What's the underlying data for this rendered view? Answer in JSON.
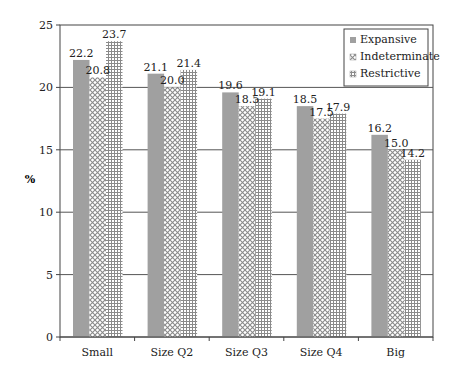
{
  "chart_data": {
    "type": "bar",
    "title": "",
    "xlabel": "",
    "ylabel": "%",
    "ylim": [
      0,
      25
    ],
    "yticks": [
      0,
      5,
      10,
      15,
      20,
      25
    ],
    "grid": true,
    "legend_position": "top-right (inside plot)",
    "categories": [
      "Small",
      "Size Q2",
      "Size Q3",
      "Size Q4",
      "Big"
    ],
    "series": [
      {
        "name": "Expansive",
        "pattern": "solid-gray",
        "values": [
          22.2,
          21.1,
          19.6,
          18.5,
          16.2
        ]
      },
      {
        "name": "Indeterminate",
        "pattern": "crosshatch-diamond",
        "values": [
          20.8,
          20.0,
          18.5,
          17.5,
          15.0
        ]
      },
      {
        "name": "Restrictive",
        "pattern": "grid",
        "values": [
          23.7,
          21.4,
          19.1,
          17.9,
          14.2
        ]
      }
    ],
    "value_labels": [
      [
        "22.2",
        "20.8",
        "23.7"
      ],
      [
        "21.1",
        "20.0",
        "21.4"
      ],
      [
        "19.6",
        "18.5",
        "19.1"
      ],
      [
        "18.5",
        "17.5",
        "17.9"
      ],
      [
        "16.2",
        "15.0",
        "14.2"
      ]
    ]
  },
  "colors": {
    "expansive_fill": "#a0a0a0",
    "pattern_stroke": "#909090",
    "gridline": "#555555",
    "axis": "#444444",
    "text": "#222222"
  }
}
